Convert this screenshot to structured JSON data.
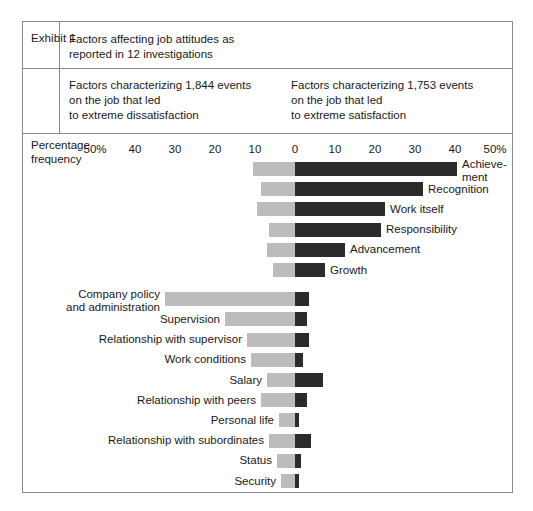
{
  "exhibit": {
    "label": "Exhibit 1",
    "title_line1": "Factors affecting job attitudes as",
    "title_line2": "reported in 12 investigations",
    "left_note_line1": "Factors characterizing 1,844 events",
    "left_note_line2": "on the job that led",
    "left_note_line3": "to extreme dissatisfaction",
    "right_note_line1": "Factors characterizing 1,753 events",
    "right_note_line2": "on the job that led",
    "right_note_line3": "to extreme satisfaction"
  },
  "axis": {
    "caption_line1": "Percentage",
    "caption_line2": "frequency",
    "tick_labels": [
      "50%",
      "40",
      "30",
      "20",
      "10",
      "0",
      "10",
      "20",
      "30",
      "40",
      "50%"
    ],
    "tick_values": [
      -50,
      -40,
      -30,
      -20,
      -10,
      0,
      10,
      20,
      30,
      40,
      50
    ]
  },
  "colors": {
    "dissatisfaction_bar": "#bcbcbc",
    "satisfaction_bar": "#2b2b2b",
    "frame": "#8a8a8a",
    "text": "#1a1a1a",
    "background": "#ffffff"
  },
  "chart_data": {
    "type": "bar",
    "title": "Factors affecting job attitudes as reported in 12 investigations",
    "orientation": "horizontal",
    "style": "diverging",
    "xlabel": "Percentage frequency",
    "ylabel": "",
    "xlim": [
      -50,
      50
    ],
    "grid": false,
    "legend_position": "top",
    "series": [
      {
        "name": "Factors characterizing 1,844 events on the job that led to extreme dissatisfaction",
        "short_name": "dissatisfaction",
        "direction": "left",
        "color": "#bcbcbc",
        "values": [
          10.5,
          8.5,
          9.5,
          6.5,
          7.0,
          5.5,
          32.5,
          17.5,
          12.0,
          11.0,
          7.0,
          8.5,
          4.0,
          6.5,
          4.5,
          3.5
        ]
      },
      {
        "name": "Factors characterizing 1,753 events on the job that led to extreme satisfaction",
        "short_name": "satisfaction",
        "direction": "right",
        "color": "#2b2b2b",
        "values": [
          40.5,
          32.0,
          22.5,
          21.5,
          12.5,
          7.5,
          3.5,
          3.0,
          3.5,
          2.0,
          7.0,
          3.0,
          1.0,
          4.0,
          1.5,
          1.0
        ]
      }
    ],
    "categories": [
      "Achievement",
      "Recognition",
      "Work itself",
      "Responsibility",
      "Advancement",
      "Growth",
      "Company policy and administration",
      "Supervision",
      "Relationship with supervisor",
      "Work conditions",
      "Salary",
      "Relationship with peers",
      "Personal life",
      "Relationship with subordinates",
      "Status",
      "Security"
    ]
  },
  "bars": [
    {
      "label": "Achieve-",
      "label2": "ment",
      "label_side": "right",
      "two_line": true,
      "neg": 10.5,
      "pos": 40.5
    },
    {
      "label": "Recognition",
      "label_side": "right",
      "two_line": false,
      "neg": 8.5,
      "pos": 32.0
    },
    {
      "label": "Work itself",
      "label_side": "right",
      "two_line": false,
      "neg": 9.5,
      "pos": 22.5
    },
    {
      "label": "Responsibility",
      "label_side": "right",
      "two_line": false,
      "neg": 6.5,
      "pos": 21.5
    },
    {
      "label": "Advancement",
      "label_side": "right",
      "two_line": false,
      "neg": 7.0,
      "pos": 12.5
    },
    {
      "label": "Growth",
      "label_side": "right",
      "two_line": false,
      "neg": 5.5,
      "pos": 7.5
    },
    {
      "label": "Company policy",
      "label2": "and administration",
      "label_side": "left",
      "two_line": true,
      "neg": 32.5,
      "pos": 3.5
    },
    {
      "label": "Supervision",
      "label_side": "left",
      "two_line": false,
      "neg": 17.5,
      "pos": 3.0
    },
    {
      "label": "Relationship with supervisor",
      "label_side": "left",
      "two_line": false,
      "neg": 12.0,
      "pos": 3.5
    },
    {
      "label": "Work conditions",
      "label_side": "left",
      "two_line": false,
      "neg": 11.0,
      "pos": 2.0
    },
    {
      "label": "Salary",
      "label_side": "left",
      "two_line": false,
      "neg": 7.0,
      "pos": 7.0
    },
    {
      "label": "Relationship with peers",
      "label_side": "left",
      "two_line": false,
      "neg": 8.5,
      "pos": 3.0
    },
    {
      "label": "Personal life",
      "label_side": "left",
      "two_line": false,
      "neg": 4.0,
      "pos": 1.0
    },
    {
      "label": "Relationship with subordinates",
      "label_side": "left",
      "two_line": false,
      "neg": 6.5,
      "pos": 4.0
    },
    {
      "label": "Status",
      "label_side": "left",
      "two_line": false,
      "neg": 4.5,
      "pos": 1.5
    },
    {
      "label": "Security",
      "label_side": "left",
      "two_line": false,
      "neg": 3.5,
      "pos": 1.0
    }
  ]
}
